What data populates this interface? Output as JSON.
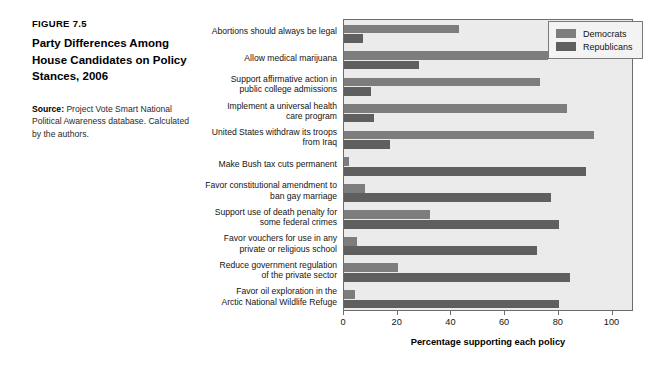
{
  "caption": {
    "figure_number": "FIGURE 7.5",
    "title": "Party Differences Among House Candidates on Policy Stances, 2006",
    "source_label": "Source:",
    "source_text": " Project Vote Smart National Political Awareness database. Calculated by the authors."
  },
  "legend": {
    "items": [
      {
        "label": "Democrats",
        "color": "#7d7d7d"
      },
      {
        "label": "Republicans",
        "color": "#5f5f5f"
      }
    ]
  },
  "chart_data": {
    "type": "bar",
    "orientation": "horizontal",
    "title": "Party Differences Among House Candidates on Policy Stances, 2006",
    "xlabel": "Percentage supporting each policy",
    "ylabel": "",
    "xlim": [
      0,
      108
    ],
    "xticks": [
      0,
      20,
      40,
      60,
      80,
      100
    ],
    "xticklabels": [
      "0",
      "20",
      "40",
      "60",
      "80",
      "100"
    ],
    "grid": false,
    "legend_position": "top-right",
    "categories": [
      "Abortions should always be legal",
      "Allow medical marijuana",
      "Support affirmative action in\npublic college admissions",
      "Implement a universal health\ncare program",
      "United States withdraw its troops\nfrom Iraq",
      "Make Bush tax cuts permanent",
      "Favor constitutional amendment to\nban gay marriage",
      "Support use of death penalty for\nsome federal crimes",
      "Favor vouchers for use in any\nprivate or religious school",
      "Reduce government regulation\nof the private sector",
      "Favor oil exploration in the\nArctic National Wildlife Refuge"
    ],
    "series": [
      {
        "name": "Democrats",
        "color": "#7d7d7d",
        "values": [
          43,
          76,
          73,
          83,
          93,
          2,
          8,
          32,
          5,
          20,
          4
        ]
      },
      {
        "name": "Republicans",
        "color": "#5f5f5f",
        "values": [
          7,
          28,
          10,
          11,
          17,
          90,
          77,
          80,
          72,
          84,
          80
        ]
      }
    ]
  }
}
